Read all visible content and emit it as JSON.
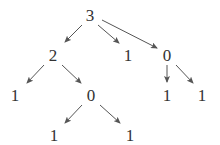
{
  "diagram": {
    "type": "tree",
    "colors": {
      "text": "#333333",
      "edge": "#555555",
      "background": "#ffffff"
    },
    "nodes": [
      {
        "id": "n0",
        "label": "3",
        "x": 90,
        "y": 15
      },
      {
        "id": "n1",
        "label": "2",
        "x": 53,
        "y": 55
      },
      {
        "id": "n2",
        "label": "1",
        "x": 128,
        "y": 55
      },
      {
        "id": "n3",
        "label": "0",
        "x": 167,
        "y": 55
      },
      {
        "id": "n4",
        "label": "1",
        "x": 15,
        "y": 95
      },
      {
        "id": "n5",
        "label": "0",
        "x": 91,
        "y": 95
      },
      {
        "id": "n6",
        "label": "1",
        "x": 167,
        "y": 95
      },
      {
        "id": "n7",
        "label": "1",
        "x": 202,
        "y": 95
      },
      {
        "id": "n8",
        "label": "1",
        "x": 54,
        "y": 135
      },
      {
        "id": "n9",
        "label": "1",
        "x": 130,
        "y": 135
      }
    ],
    "edges": [
      {
        "from": "n0",
        "to": "n1",
        "x1": 82,
        "y1": 25,
        "x2": 65,
        "y2": 42
      },
      {
        "from": "n0",
        "to": "n2",
        "x1": 98,
        "y1": 25,
        "x2": 119,
        "y2": 43
      },
      {
        "from": "n0",
        "to": "n3",
        "x1": 102,
        "y1": 20,
        "x2": 157,
        "y2": 48
      },
      {
        "from": "n1",
        "to": "n4",
        "x1": 44,
        "y1": 65,
        "x2": 27,
        "y2": 83
      },
      {
        "from": "n1",
        "to": "n5",
        "x1": 62,
        "y1": 65,
        "x2": 81,
        "y2": 83
      },
      {
        "from": "n3",
        "to": "n6",
        "x1": 167,
        "y1": 65,
        "x2": 167,
        "y2": 82
      },
      {
        "from": "n3",
        "to": "n7",
        "x1": 176,
        "y1": 65,
        "x2": 193,
        "y2": 83
      },
      {
        "from": "n5",
        "to": "n8",
        "x1": 82,
        "y1": 105,
        "x2": 65,
        "y2": 123
      },
      {
        "from": "n5",
        "to": "n9",
        "x1": 100,
        "y1": 105,
        "x2": 120,
        "y2": 123
      }
    ]
  }
}
